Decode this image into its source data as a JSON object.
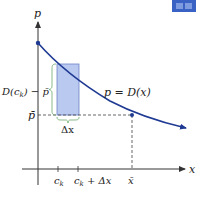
{
  "diagram": {
    "colors": {
      "curve": "#1f3a93",
      "rect_fill": "#b9c9f0",
      "rect_stroke": "#6f86c9",
      "brace": "#6aa86a",
      "axis": "#444444",
      "dashed": "#555555",
      "icon": "#3a62c4"
    },
    "axis_labels": {
      "y": "p",
      "x": "x"
    },
    "curve_label": "p = D(x)",
    "left_labels": {
      "height": "D(c",
      "height_sub": "k",
      "height_rest": ") − p̄",
      "pbar": "p̄"
    },
    "width_label": "Δx",
    "x_ticks": [
      {
        "label": "c",
        "sub": "k",
        "rest": ""
      },
      {
        "label": "c",
        "sub": "k",
        "rest": " + Δx"
      },
      {
        "label": "x̄",
        "sub": "",
        "rest": ""
      }
    ],
    "icon": "book-icon"
  }
}
